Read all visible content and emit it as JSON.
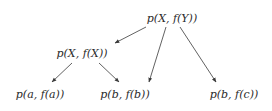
{
  "diagram": {
    "type": "tree",
    "nodes": [
      {
        "id": "root",
        "label": "p(X, f(Y))"
      },
      {
        "id": "mid",
        "label": "p(X, f(X))"
      },
      {
        "id": "leaf_a",
        "label": "p(a, f(a))"
      },
      {
        "id": "leaf_b",
        "label": "p(b, f(b))"
      },
      {
        "id": "leaf_c",
        "label": "p(b, f(c))"
      }
    ],
    "edges": [
      {
        "from": "root",
        "to": "mid"
      },
      {
        "from": "root",
        "to": "leaf_b"
      },
      {
        "from": "root",
        "to": "leaf_c"
      },
      {
        "from": "mid",
        "to": "leaf_a"
      },
      {
        "from": "mid",
        "to": "leaf_b"
      }
    ],
    "colors": {
      "text": "#2a2a2a",
      "edge": "#3a3a3a",
      "background": "#ffffff"
    }
  }
}
